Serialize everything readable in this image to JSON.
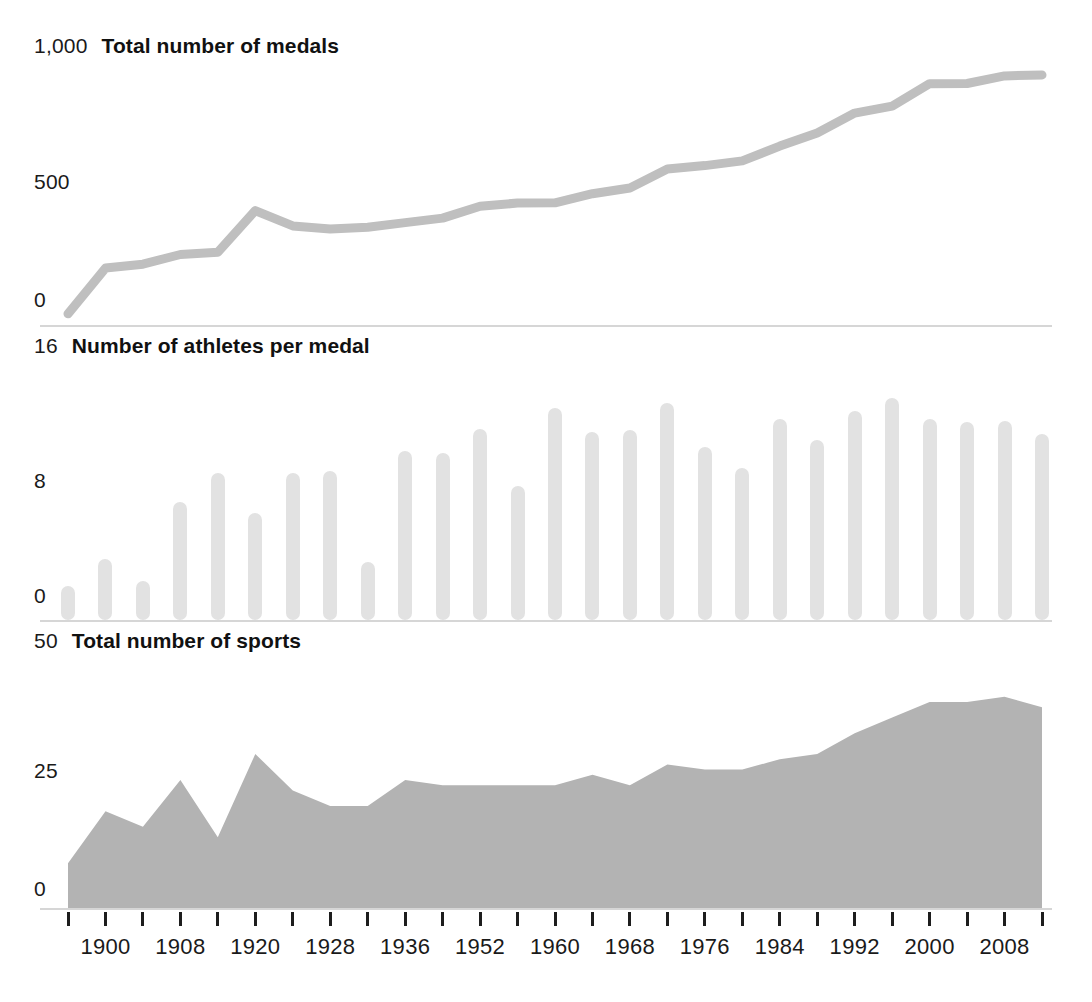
{
  "chart_data": [
    {
      "type": "line",
      "title": "Total number of medals",
      "xlabel": "",
      "ylabel": "",
      "ylim": [
        0,
        1000
      ],
      "yticks": [
        0,
        500,
        1000
      ],
      "ytick_labels": [
        "0",
        "500",
        "1,000"
      ],
      "grid": false,
      "legend": "none",
      "x": [
        1896,
        1900,
        1904,
        1908,
        1912,
        1920,
        1924,
        1928,
        1932,
        1936,
        1948,
        1952,
        1956,
        1960,
        1964,
        1968,
        1972,
        1976,
        1980,
        1984,
        1988,
        1992,
        1996,
        2000,
        2004,
        2008,
        2012
      ],
      "values": [
        43,
        219,
        234,
        271,
        280,
        440,
        381,
        369,
        376,
        394,
        411,
        457,
        469,
        470,
        505,
        527,
        600,
        613,
        631,
        688,
        739,
        815,
        842,
        928,
        929,
        958,
        962
      ]
    },
    {
      "type": "bar",
      "title": "Number of athletes per medal",
      "xlabel": "",
      "ylabel": "",
      "ylim": [
        0,
        16
      ],
      "yticks": [
        0,
        8,
        16
      ],
      "ytick_labels": [
        "0",
        "8",
        "16"
      ],
      "grid": false,
      "legend": "none",
      "categories": [
        1896,
        1900,
        1904,
        1908,
        1912,
        1920,
        1924,
        1928,
        1932,
        1936,
        1948,
        1952,
        1956,
        1960,
        1964,
        1968,
        1972,
        1976,
        1980,
        1984,
        1988,
        1992,
        1996,
        2000,
        2004,
        2008,
        2012
      ],
      "values": [
        0.6,
        2.3,
        0.9,
        5.8,
        7.6,
        5.1,
        7.6,
        7.7,
        2.1,
        8.9,
        8.8,
        10.3,
        6.8,
        11.6,
        10.1,
        10.2,
        11.9,
        9.2,
        7.9,
        10.9,
        9.6,
        11.4,
        12.2,
        10.9,
        10.7,
        10.8,
        10.0
      ]
    },
    {
      "type": "area",
      "title": "Total number of sports",
      "xlabel": "",
      "ylabel": "",
      "ylim": [
        0,
        50
      ],
      "yticks": [
        0,
        25,
        50
      ],
      "ytick_labels": [
        "0",
        "25",
        "50"
      ],
      "grid": false,
      "legend": "none",
      "x": [
        1896,
        1900,
        1904,
        1908,
        1912,
        1920,
        1924,
        1928,
        1932,
        1936,
        1948,
        1952,
        1956,
        1960,
        1964,
        1968,
        1972,
        1976,
        1980,
        1984,
        1988,
        1992,
        1996,
        2000,
        2004,
        2008,
        2012
      ],
      "values": [
        9,
        19,
        16,
        25,
        14,
        30,
        23,
        20,
        20,
        25,
        24,
        24,
        24,
        24,
        26,
        24,
        28,
        27,
        27,
        29,
        30,
        34,
        37,
        40,
        40,
        41,
        39
      ]
    }
  ],
  "axis": {
    "tick_years": [
      1896,
      1900,
      1904,
      1908,
      1912,
      1920,
      1924,
      1928,
      1932,
      1936,
      1948,
      1952,
      1956,
      1960,
      1964,
      1968,
      1972,
      1976,
      1980,
      1984,
      1988,
      1992,
      1996,
      2000,
      2004,
      2008,
      2012
    ],
    "labels": [
      "1900",
      "1908",
      "1920",
      "1928",
      "1936",
      "1952",
      "1960",
      "1968",
      "1976",
      "1984",
      "1992",
      "2000",
      "2008"
    ],
    "labeled_indices": [
      1,
      3,
      5,
      7,
      9,
      11,
      13,
      15,
      17,
      19,
      21,
      23,
      25
    ]
  },
  "panels": {
    "medals": {
      "title": "Total number of medals",
      "top_value": "1,000",
      "mid_value": "500",
      "zero_value": "0"
    },
    "athletes": {
      "title": "Number of athletes per medal",
      "top_value": "16",
      "mid_value": "8",
      "zero_value": "0"
    },
    "sports": {
      "title": "Total number of sports",
      "top_value": "50",
      "mid_value": "25",
      "zero_value": "0"
    }
  },
  "colors": {
    "line": "#bfbfbf",
    "bar": "#e2e2e2",
    "area": "#b3b3b3",
    "baseline": "#d6d6d6",
    "tick": "#1d1d1d",
    "text": "#1a1a1a"
  }
}
